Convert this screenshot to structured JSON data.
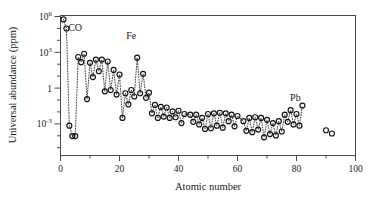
{
  "figure": {
    "background_color": "#ffffff",
    "frame_color": "#4a4a4a",
    "marker_color": "#111111",
    "connector_color": "#333333"
  },
  "chart_data": {
    "type": "scatter",
    "title": "",
    "subtitle": "",
    "xlabel": "Atomic number",
    "ylabel": "Universal abundance (ppm)",
    "xlim": [
      0,
      100
    ],
    "ylim_log10": [
      -4.5,
      6.3
    ],
    "yscale": "log",
    "xscale": "linear",
    "grid": false,
    "legend": "none",
    "marker_style": "open-circle",
    "line_style": "dotted",
    "xticks": [
      0,
      20,
      40,
      60,
      80,
      100
    ],
    "xtick_labels": [
      "0",
      "20",
      "40",
      "60",
      "80",
      "100"
    ],
    "ytick_exponents": [
      6,
      3,
      0,
      -3
    ],
    "ytick_labels": [
      "10⁶",
      "10³",
      "1",
      "10⁻³"
    ],
    "ytick_base": [
      "10",
      "10",
      "1",
      "10"
    ],
    "ytick_sup": [
      "6",
      "3",
      "",
      "-3"
    ],
    "annotations": [
      {
        "text": "CO",
        "x": 7,
        "y_log10": 4.55,
        "dx": -6,
        "dy": -7
      },
      {
        "text": "Fe",
        "x": 26,
        "y_log10": 3.95,
        "dx": -6,
        "dy": -7
      },
      {
        "text": "Pb",
        "x": 82,
        "y_log10": -0.85,
        "dx": -7,
        "dy": -7
      }
    ],
    "x": [
      1,
      2,
      3,
      4,
      5,
      6,
      7,
      8,
      9,
      10,
      11,
      12,
      13,
      14,
      15,
      16,
      17,
      18,
      19,
      20,
      21,
      22,
      23,
      24,
      25,
      26,
      27,
      28,
      29,
      30,
      31,
      32,
      33,
      34,
      35,
      36,
      37,
      38,
      39,
      40,
      41,
      42,
      44,
      45,
      46,
      47,
      48,
      49,
      50,
      51,
      52,
      53,
      54,
      55,
      56,
      57,
      58,
      59,
      60,
      62,
      63,
      64,
      65,
      66,
      67,
      68,
      69,
      70,
      71,
      72,
      73,
      74,
      75,
      76,
      77,
      78,
      79,
      80,
      81,
      82,
      90,
      92
    ],
    "y_log10": [
      6.0,
      5.3,
      -2.2,
      -3.0,
      -3.0,
      3.1,
      2.7,
      3.35,
      -0.15,
      2.65,
      1.55,
      2.9,
      2.0,
      2.9,
      0.45,
      2.75,
      0.55,
      2.1,
      0.2,
      1.75,
      -1.6,
      0.3,
      -0.55,
      0.55,
      0.05,
      3.05,
      0.3,
      1.8,
      -0.05,
      0.35,
      -1.25,
      -0.6,
      -1.6,
      -0.75,
      -1.5,
      -0.8,
      -1.6,
      -1.1,
      -1.55,
      -1.05,
      -2.0,
      -1.3,
      -1.35,
      -1.9,
      -1.35,
      -2.1,
      -1.6,
      -2.45,
      -1.3,
      -2.4,
      -1.25,
      -2.2,
      -1.2,
      -2.35,
      -1.25,
      -1.85,
      -1.35,
      -2.25,
      -1.45,
      -1.85,
      -2.6,
      -1.6,
      -2.7,
      -1.55,
      -2.5,
      -1.6,
      -3.1,
      -1.75,
      -2.85,
      -2.0,
      -2.95,
      -1.85,
      -2.65,
      -1.35,
      -1.9,
      -1.0,
      -2.1,
      -1.3,
      -2.2,
      -0.65,
      -2.55,
      -2.8
    ],
    "connected_range": [
      1,
      82
    ],
    "isolated_points": [
      90,
      92
    ]
  },
  "axes": {
    "y_title": "Universal abundance (ppm)",
    "x_title": "Atomic number"
  }
}
